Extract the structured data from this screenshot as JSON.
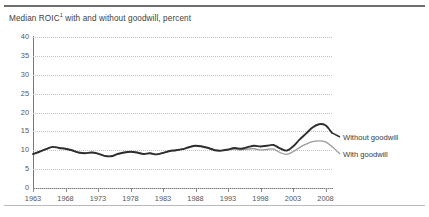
{
  "exhibit": {
    "title_main": "Median ROIC",
    "title_footnote_marker": "1",
    "title_rest": " with and without goodwill, percent"
  },
  "chart_data": {
    "type": "line",
    "xlabel": "",
    "ylabel": "percent",
    "grid": true,
    "legend_position": "right-inline",
    "xlim": [
      1963,
      2009
    ],
    "ylim": [
      0,
      40
    ],
    "yticks": [
      0,
      5,
      10,
      15,
      20,
      25,
      30,
      35,
      40
    ],
    "xticks": [
      1963,
      1968,
      1973,
      1978,
      1983,
      1988,
      1993,
      1998,
      2003,
      2008
    ],
    "x": [
      1963,
      1964,
      1965,
      1966,
      1967,
      1968,
      1969,
      1970,
      1971,
      1972,
      1973,
      1974,
      1975,
      1976,
      1977,
      1978,
      1979,
      1980,
      1981,
      1982,
      1983,
      1984,
      1985,
      1986,
      1987,
      1988,
      1989,
      1990,
      1991,
      1992,
      1993,
      1994,
      1995,
      1996,
      1997,
      1998,
      1999,
      2000,
      2001,
      2002,
      2003,
      2004,
      2005,
      2006,
      2007,
      2008,
      2009
    ],
    "series": [
      {
        "name": "Without goodwill",
        "color": "#2e2e2e",
        "values": [
          9.0,
          9.6,
          10.3,
          10.9,
          10.6,
          10.4,
          10.0,
          9.4,
          9.2,
          9.4,
          9.1,
          8.5,
          8.4,
          9.0,
          9.4,
          9.6,
          9.4,
          9.0,
          9.2,
          8.9,
          9.3,
          9.8,
          10.0,
          10.3,
          10.8,
          11.2,
          11.0,
          10.6,
          10.0,
          9.9,
          10.2,
          10.6,
          10.4,
          10.8,
          11.2,
          11.0,
          11.2,
          11.4,
          10.5,
          9.9,
          11.0,
          12.8,
          14.4,
          16.0,
          16.9,
          16.6,
          14.6
        ]
      },
      {
        "name": "With goodwill",
        "color": "#9a9a9c",
        "values": [
          9.0,
          9.6,
          10.3,
          10.9,
          10.6,
          10.4,
          10.0,
          9.4,
          9.2,
          9.4,
          9.1,
          8.5,
          8.4,
          9.0,
          9.4,
          9.6,
          9.4,
          9.0,
          9.2,
          8.9,
          9.3,
          9.8,
          10.0,
          10.3,
          10.8,
          11.2,
          11.0,
          10.6,
          10.0,
          9.9,
          10.1,
          10.3,
          10.1,
          10.3,
          10.4,
          10.1,
          10.2,
          10.3,
          9.4,
          8.9,
          9.6,
          10.7,
          11.6,
          12.3,
          12.5,
          12.2,
          11.0
        ]
      }
    ],
    "annotations": [
      {
        "text": "Without goodwill",
        "series": 0
      },
      {
        "text": "With goodwill",
        "series": 1
      }
    ]
  }
}
